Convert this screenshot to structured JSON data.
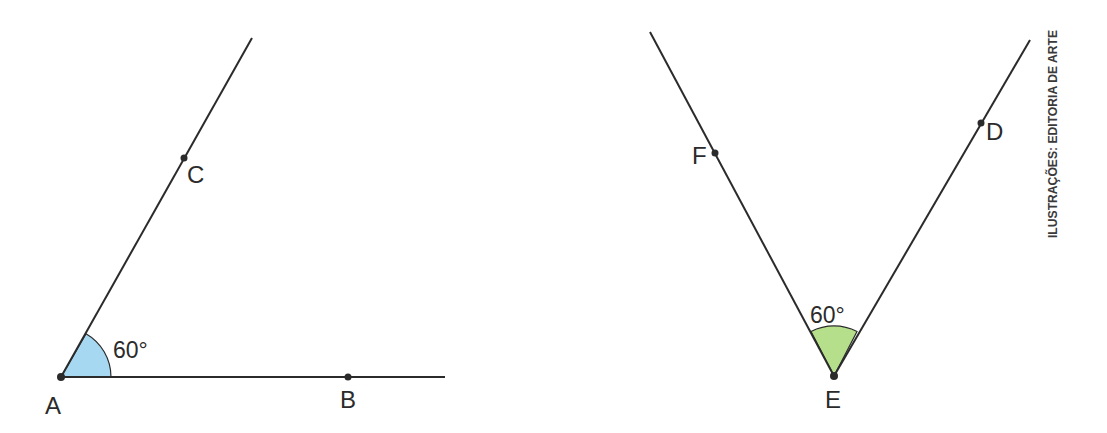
{
  "figures": [
    {
      "id": "angle-cab",
      "vertex": "A",
      "points": {
        "A": "A",
        "B": "B",
        "C": "C"
      },
      "angle_label": "60°",
      "fill_color": "#a6d8f2"
    },
    {
      "id": "angle-feD",
      "vertex": "E",
      "points": {
        "D": "D",
        "E": "E",
        "F": "F"
      },
      "angle_label": "60°",
      "fill_color": "#b5df8a"
    }
  ],
  "credit": "ILUSTRAÇÕES: EDITORIA DE ARTE",
  "colors": {
    "line": "#2b2b2b",
    "blue_sector": "#a6d8f2",
    "green_sector": "#b5df8a"
  }
}
